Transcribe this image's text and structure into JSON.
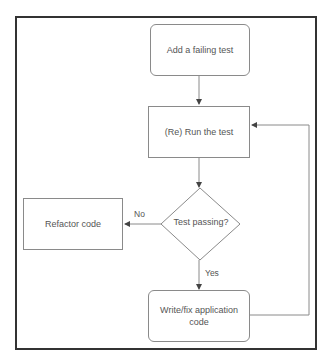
{
  "diagram": {
    "type": "flowchart",
    "nodes": [
      {
        "id": "add_test",
        "shape": "rounded-rect",
        "label": "Add a failing test"
      },
      {
        "id": "run_test",
        "shape": "rect",
        "label": "(Re) Run the test"
      },
      {
        "id": "decision",
        "shape": "diamond",
        "label": "Test passing?"
      },
      {
        "id": "refactor",
        "shape": "rect",
        "label": "Refactor code"
      },
      {
        "id": "write_code",
        "shape": "rounded-rect",
        "label_line1": "Write/fix application",
        "label_line2": "code"
      }
    ],
    "edges": [
      {
        "from": "add_test",
        "to": "run_test",
        "label": ""
      },
      {
        "from": "run_test",
        "to": "decision",
        "label": ""
      },
      {
        "from": "decision",
        "to": "refactor",
        "label": "No"
      },
      {
        "from": "decision",
        "to": "write_code",
        "label": "Yes"
      },
      {
        "from": "write_code",
        "to": "run_test",
        "label": ""
      }
    ],
    "edge_labels": {
      "no": "No",
      "yes": "Yes"
    },
    "colors": {
      "frame": "#333333",
      "stroke": "#8a8a8a",
      "text": "#555555",
      "background": "#ffffff"
    }
  }
}
